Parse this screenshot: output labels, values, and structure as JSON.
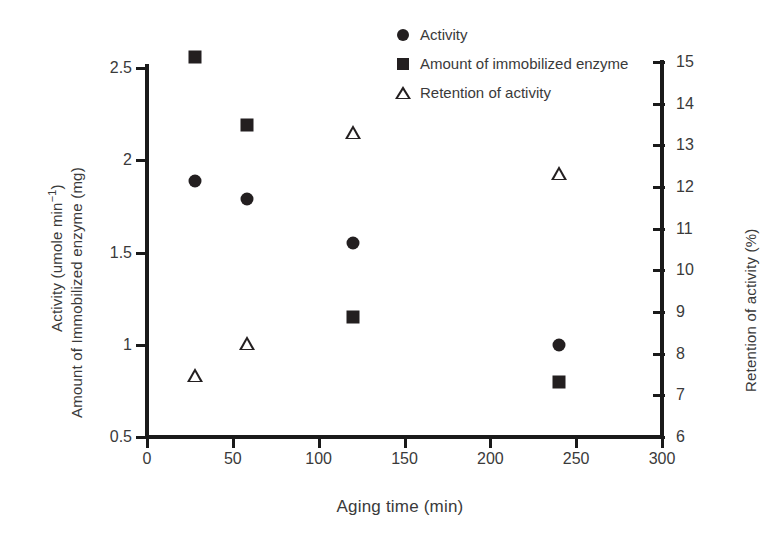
{
  "chart_data": {
    "type": "scatter",
    "title": "",
    "xlabel": "Aging time (min)",
    "ylabel_left_top": "Activity (umole min⁻¹)",
    "ylabel_left_bottom": "Amount of Immobilized enzyme (mg)",
    "ylabel_right": "Retention of activity (%)",
    "xlim": [
      0,
      300
    ],
    "xticks": [
      0,
      50,
      100,
      150,
      200,
      250,
      300
    ],
    "xtick_labels": [
      "0",
      "50",
      "100",
      "150",
      "200",
      "250",
      "300"
    ],
    "ylim_left": [
      0.5,
      2.5
    ],
    "yticks_left": [
      0.5,
      1,
      1.5,
      2,
      2.5
    ],
    "ytick_labels_left": [
      "0.5",
      "1",
      "1.5",
      "2",
      "2.5"
    ],
    "ylim_right": [
      6,
      15
    ],
    "yticks_right": [
      6,
      7,
      8,
      9,
      10,
      11,
      12,
      13,
      14,
      15
    ],
    "ytick_labels_right": [
      "6",
      "7",
      "8",
      "9",
      "10",
      "11",
      "12",
      "13",
      "14",
      "15"
    ],
    "grid": false,
    "legend_position": "top-right",
    "series": [
      {
        "name": "Activity",
        "marker": "circle",
        "axis": "left",
        "color": "#231f20",
        "x": [
          28,
          58,
          120,
          240
        ],
        "values": [
          1.89,
          1.79,
          1.55,
          1.0
        ]
      },
      {
        "name": "Amount of immobilized enzyme",
        "marker": "square",
        "axis": "left",
        "color": "#231f20",
        "x": [
          28,
          58,
          120,
          240
        ],
        "values": [
          2.56,
          2.19,
          1.15,
          0.8
        ]
      },
      {
        "name": "Retention of activity",
        "marker": "triangle",
        "axis": "right",
        "color": "#231f20",
        "x": [
          28,
          58,
          120,
          240
        ],
        "values": [
          7.5,
          8.6,
          14.0,
          13.35
        ]
      }
    ]
  },
  "legend": {
    "items": [
      {
        "label": "Activity",
        "marker": "circle"
      },
      {
        "label": "Amount of immobilized enzyme",
        "marker": "square"
      },
      {
        "label": "Retention of activity",
        "marker": "triangle"
      }
    ]
  }
}
